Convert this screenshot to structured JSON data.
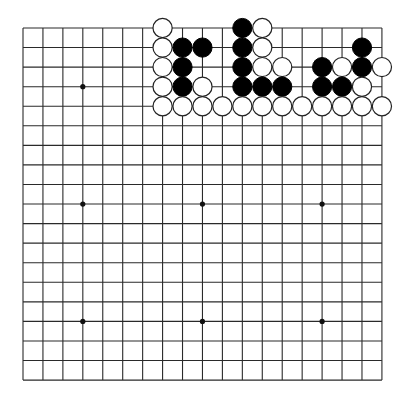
{
  "board": {
    "size": 19,
    "origin_x": 23,
    "origin_y": 28,
    "spacing_x": 19.94,
    "spacing_y": 19.56,
    "stone_radius": 9.6,
    "star_radius": 2.6,
    "colors": {
      "background": "#ffffff",
      "line": "#2a2a2a",
      "black": "#000000",
      "white": "#ffffff"
    },
    "star_points": [
      [
        3,
        3
      ],
      [
        3,
        9
      ],
      [
        3,
        15
      ],
      [
        9,
        3
      ],
      [
        9,
        9
      ],
      [
        9,
        15
      ],
      [
        15,
        3
      ],
      [
        15,
        9
      ],
      [
        15,
        15
      ]
    ],
    "stones": [
      {
        "row": 0,
        "col": 7,
        "color": "white"
      },
      {
        "row": 0,
        "col": 11,
        "color": "black"
      },
      {
        "row": 0,
        "col": 12,
        "color": "white"
      },
      {
        "row": 1,
        "col": 7,
        "color": "white"
      },
      {
        "row": 1,
        "col": 8,
        "color": "black"
      },
      {
        "row": 1,
        "col": 9,
        "color": "black"
      },
      {
        "row": 1,
        "col": 11,
        "color": "black"
      },
      {
        "row": 1,
        "col": 12,
        "color": "white"
      },
      {
        "row": 1,
        "col": 17,
        "color": "black"
      },
      {
        "row": 2,
        "col": 7,
        "color": "white"
      },
      {
        "row": 2,
        "col": 8,
        "color": "black"
      },
      {
        "row": 2,
        "col": 11,
        "color": "black"
      },
      {
        "row": 2,
        "col": 12,
        "color": "white"
      },
      {
        "row": 2,
        "col": 13,
        "color": "white"
      },
      {
        "row": 2,
        "col": 15,
        "color": "black"
      },
      {
        "row": 2,
        "col": 16,
        "color": "white"
      },
      {
        "row": 2,
        "col": 17,
        "color": "black"
      },
      {
        "row": 2,
        "col": 18,
        "color": "white"
      },
      {
        "row": 3,
        "col": 7,
        "color": "white"
      },
      {
        "row": 3,
        "col": 8,
        "color": "black"
      },
      {
        "row": 3,
        "col": 9,
        "color": "white"
      },
      {
        "row": 3,
        "col": 11,
        "color": "black"
      },
      {
        "row": 3,
        "col": 12,
        "color": "black"
      },
      {
        "row": 3,
        "col": 13,
        "color": "black"
      },
      {
        "row": 3,
        "col": 15,
        "color": "black"
      },
      {
        "row": 3,
        "col": 16,
        "color": "black"
      },
      {
        "row": 3,
        "col": 17,
        "color": "white"
      },
      {
        "row": 4,
        "col": 7,
        "color": "white"
      },
      {
        "row": 4,
        "col": 8,
        "color": "white"
      },
      {
        "row": 4,
        "col": 9,
        "color": "white"
      },
      {
        "row": 4,
        "col": 10,
        "color": "white"
      },
      {
        "row": 4,
        "col": 11,
        "color": "white"
      },
      {
        "row": 4,
        "col": 12,
        "color": "white"
      },
      {
        "row": 4,
        "col": 13,
        "color": "white"
      },
      {
        "row": 4,
        "col": 14,
        "color": "white"
      },
      {
        "row": 4,
        "col": 15,
        "color": "white"
      },
      {
        "row": 4,
        "col": 16,
        "color": "white"
      },
      {
        "row": 4,
        "col": 17,
        "color": "white"
      },
      {
        "row": 4,
        "col": 18,
        "color": "white"
      }
    ]
  }
}
